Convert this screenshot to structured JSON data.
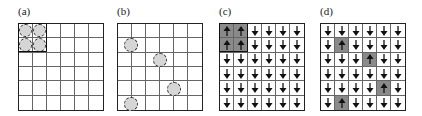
{
  "figure": {
    "panels": [
      {
        "id": "a",
        "label": "(a)",
        "grid_size": 6,
        "type": "circles",
        "circles_cells": [
          [
            0,
            0
          ],
          [
            0,
            1
          ],
          [
            1,
            0
          ],
          [
            1,
            1
          ]
        ],
        "highlight_block": {
          "row": 0,
          "col": 0,
          "rows": 2,
          "cols": 2
        }
      },
      {
        "id": "b",
        "label": "(b)",
        "grid_size": 6,
        "type": "circles-on-lines",
        "circles_points": [
          {
            "vline": 1,
            "row": 1
          },
          {
            "vline": 3,
            "row": 2
          },
          {
            "vline": 4,
            "row": 4
          },
          {
            "vline": 1,
            "row": 5
          }
        ]
      },
      {
        "id": "c",
        "label": "(c)",
        "grid_size": 6,
        "type": "spins",
        "up_cells": [
          [
            0,
            0
          ],
          [
            0,
            1
          ],
          [
            1,
            0
          ],
          [
            1,
            1
          ]
        ],
        "highlight_block": {
          "row": 0,
          "col": 0,
          "rows": 2,
          "cols": 2
        }
      },
      {
        "id": "d",
        "label": "(d)",
        "grid_size": 6,
        "type": "spins",
        "up_cells": [
          [
            1,
            1
          ],
          [
            2,
            3
          ],
          [
            4,
            4
          ],
          [
            5,
            1
          ]
        ]
      }
    ],
    "colors": {
      "grid_line": "#666666",
      "border": "#222222",
      "up_spin_fill": "#8a8a8a",
      "circle_fill": "#d6d6d6",
      "arrow": "#111111"
    },
    "icons": {
      "up": "arrow-up-icon",
      "down": "arrow-down-icon",
      "particle": "circle-icon"
    }
  }
}
